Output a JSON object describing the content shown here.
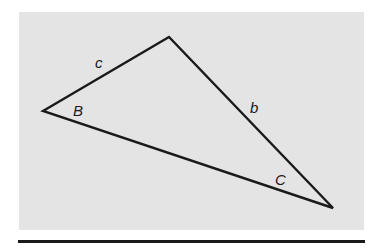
{
  "figure": {
    "vertices": {
      "B": {
        "x": 43,
        "y": 111
      },
      "A": {
        "x": 169,
        "y": 37
      },
      "C": {
        "x": 333,
        "y": 208
      }
    },
    "side_labels": [
      {
        "id": "c",
        "text": "c",
        "x": 95,
        "y": 68
      },
      {
        "id": "b",
        "text": "b",
        "x": 250,
        "y": 113
      }
    ],
    "angle_labels": [
      {
        "id": "B",
        "text": "B",
        "x": 73,
        "y": 116
      },
      {
        "id": "C",
        "text": "C",
        "x": 275,
        "y": 185
      }
    ],
    "colors": {
      "panel": "#e4e4e4",
      "stroke": "#1a1a1a"
    }
  }
}
